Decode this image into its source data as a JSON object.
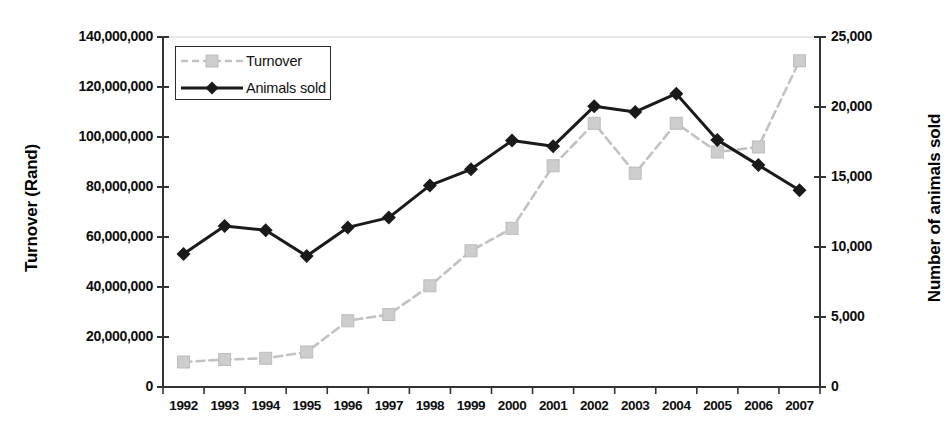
{
  "chart_data": {
    "type": "line",
    "title": "",
    "xlabel": "",
    "categories": [
      "1992",
      "1993",
      "1994",
      "1995",
      "1996",
      "1997",
      "1998",
      "1999",
      "2000",
      "2001",
      "2002",
      "2003",
      "2004",
      "2005",
      "2006",
      "2007"
    ],
    "grid": false,
    "legend_position": "top-left inside",
    "series": [
      {
        "name": "Turnover",
        "axis": "left",
        "color": "#c2c2c2",
        "marker": "square",
        "linestyle": "dashed",
        "values": [
          10000000,
          11000000,
          11500000,
          14000000,
          26500000,
          29000000,
          40500000,
          54500000,
          63500000,
          88500000,
          105500000,
          85500000,
          105500000,
          94000000,
          96000000,
          130500000
        ]
      },
      {
        "name": "Animals sold",
        "axis": "right",
        "color": "#1a1a1a",
        "marker": "diamond",
        "linestyle": "solid",
        "values": [
          9500,
          11500,
          11200,
          9350,
          11400,
          12100,
          14400,
          15550,
          17600,
          17200,
          20050,
          19650,
          20950,
          17650,
          15850,
          14050
        ]
      }
    ],
    "left_axis": {
      "label": "Turnover (Rand)",
      "min": 0,
      "max": 140000000,
      "step": 20000000,
      "ticks": [
        "0",
        "20,000,000",
        "40,000,000",
        "60,000,000",
        "80,000,000",
        "100,000,000",
        "120,000,000",
        "140,000,000"
      ]
    },
    "right_axis": {
      "label": "Number of animals sold",
      "min": 0,
      "max": 25000,
      "step": 5000,
      "ticks": [
        "0",
        "5,000",
        "10,000",
        "15,000",
        "20,000",
        "25,000"
      ]
    },
    "legend": [
      {
        "label": "Turnover"
      },
      {
        "label": "Animals sold"
      }
    ]
  }
}
